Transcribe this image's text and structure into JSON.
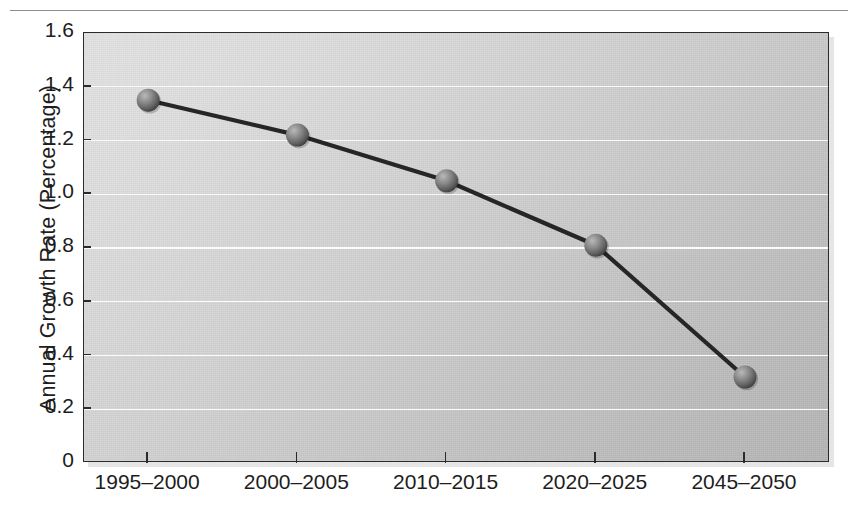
{
  "chart_data": {
    "type": "line",
    "title": "",
    "subtitle": "",
    "xlabel": "",
    "ylabel": "Annual Growth Rate (Percentage)",
    "categories": [
      "1995–2000",
      "2000–2005",
      "2010–2015",
      "2020–2025",
      "2045–2050"
    ],
    "values": [
      1.35,
      1.22,
      1.05,
      0.81,
      0.32
    ],
    "series": [
      {
        "name": "Annual Growth Rate",
        "values": [
          1.35,
          1.22,
          1.05,
          0.81,
          0.32
        ]
      }
    ],
    "ylim": [
      0,
      1.6
    ],
    "ytick_labels": [
      "1.6",
      "1.4",
      "1.2",
      "1.0",
      "0.8",
      "0.6",
      "0.4",
      "0.2",
      "0"
    ],
    "ytick_values": [
      1.6,
      1.4,
      1.2,
      1.0,
      0.8,
      0.6,
      0.4,
      0.2,
      0
    ],
    "grid": true,
    "gridline_color": "#fbfbfb",
    "legend": null,
    "legend_position": "none",
    "marker": "sphere",
    "line_color": "#262626",
    "marker_color": "#6e6e6e",
    "plot_background": "#cccccc",
    "axis_color": "#2b2b2b",
    "text_color": "#1d1d1d",
    "annotations": []
  },
  "figure": {
    "top_rule": true
  }
}
